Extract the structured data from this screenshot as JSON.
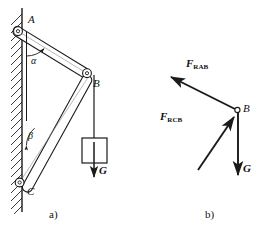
{
  "figure": {
    "stroke_color": "#1a1a1a",
    "background_color": "#ffffff",
    "panels": [
      {
        "caption": "a)",
        "name": "mechanism-diagram",
        "points": [
          {
            "label": "A",
            "name": "joint-a",
            "kind": "pin-joint"
          },
          {
            "label": "B",
            "name": "joint-b",
            "kind": "pin-joint"
          },
          {
            "label": "C",
            "name": "joint-c",
            "kind": "pin-joint"
          }
        ],
        "angles": [
          {
            "label": "α",
            "name": "angle-alpha",
            "at": "A"
          },
          {
            "label": "β",
            "name": "angle-beta",
            "at": "C"
          }
        ],
        "members": [
          {
            "name": "bar-ab",
            "from": "A",
            "to": "B"
          },
          {
            "name": "bar-cb",
            "from": "C",
            "to": "B"
          }
        ],
        "load": {
          "label": "G",
          "name": "weight-force",
          "direction": "down"
        },
        "wall": {
          "name": "fixed-wall",
          "hatching": "diagonal"
        }
      },
      {
        "caption": "b)",
        "name": "free-body-diagram",
        "points": [
          {
            "label": "B",
            "name": "joint-b",
            "kind": "node"
          }
        ],
        "forces": [
          {
            "symbol": "F",
            "subscript": "RAB",
            "name": "force-rab",
            "direction": "up-left"
          },
          {
            "symbol": "F",
            "subscript": "RCB",
            "name": "force-rcb",
            "direction": "up-right"
          },
          {
            "symbol": "G",
            "subscript": "",
            "name": "weight-force",
            "direction": "down"
          }
        ]
      }
    ]
  }
}
